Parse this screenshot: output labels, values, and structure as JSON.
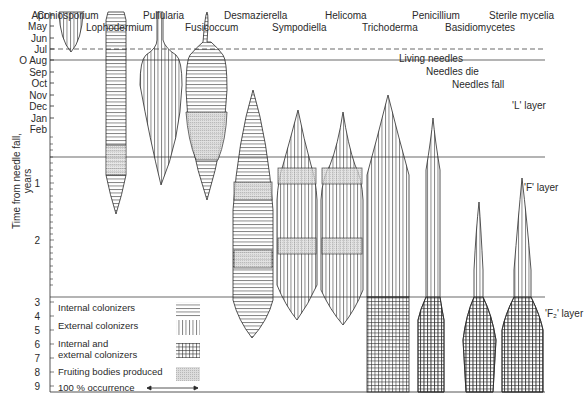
{
  "genera": [
    {
      "name": "Coniosporium",
      "x": 66,
      "y": 10
    },
    {
      "name": "Lophodermium",
      "x": 86,
      "y": 22
    },
    {
      "name": "Pullularia",
      "x": 143,
      "y": 10
    },
    {
      "name": "Fusicoccum",
      "x": 185,
      "y": 22
    },
    {
      "name": "Desmazierella",
      "x": 224,
      "y": 10
    },
    {
      "name": "Sympodiella",
      "x": 272,
      "y": 22
    },
    {
      "name": "Helicoma",
      "x": 325,
      "y": 10
    },
    {
      "name": "Trichoderma",
      "x": 362,
      "y": 22
    },
    {
      "name": "Penicillium",
      "x": 412,
      "y": 10
    },
    {
      "name": "Basidiomycetes",
      "x": 445,
      "y": 22
    },
    {
      "name": "Sterile mycelia",
      "x": 489,
      "y": 10
    }
  ],
  "annotations": {
    "living_needles": "Living needles",
    "needles_die": "Needles die",
    "needles_fall": "Needles fall",
    "l_layer": "'L' layer",
    "f_layer": "'F' layer",
    "f2_layer": "'F₂' layer"
  },
  "y_axis": {
    "label": "Time from needle fall, years",
    "months": [
      "Apr",
      "May",
      "Jun",
      "Jul",
      "O Aug",
      "Sep",
      "Oct",
      "Nov",
      "Dec",
      "Jan",
      "Feb"
    ],
    "years": [
      "1",
      "2",
      "3",
      "4",
      "5",
      "6",
      "7",
      "8",
      "9"
    ]
  },
  "legend": {
    "internal": "Internal colonizers",
    "external": "External colonizers",
    "both_line1": "Internal and",
    "both_line2": "external colonizers",
    "fruiting": "Fruiting bodies produced",
    "occurrence": "100 % occurrence"
  },
  "colors": {
    "ink": "#2a2a2a",
    "fruiting_fill": "#d6d6d6",
    "background": "#ffffff"
  }
}
